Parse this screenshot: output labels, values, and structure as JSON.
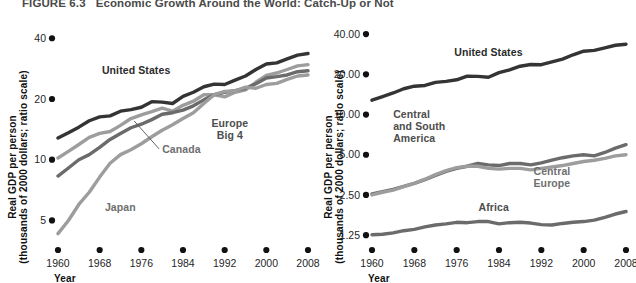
{
  "figure": {
    "number": "FIGURE 6.3",
    "caption": "Economic Growth Around the World: Catch-Up or Not"
  },
  "colors": {
    "dark": "#343434",
    "mid": "#6b6b6b",
    "light": "#9d9d9d",
    "axis": "#111111",
    "text": "#1a1a1a"
  },
  "chart_data": [
    {
      "type": "line",
      "id": "left",
      "title": "Catch-Up: Rich Industrial Countries",
      "xlabel": "Year",
      "ylabel": "Real GDP per person (thousands of 2000 dollars; ratio scale)",
      "ylabel_line1": "Real GDP per person",
      "ylabel_line2": "(thousands of 2000 dollars; ratio scale)",
      "xticks": [
        "1960",
        "1968",
        "1976",
        "1984",
        "1992",
        "2000",
        "2008"
      ],
      "xvalues": [
        1960,
        1968,
        1976,
        1984,
        1992,
        2000,
        2008
      ],
      "yticks": [
        "40",
        "20",
        "10",
        "5"
      ],
      "yvalues": [
        40,
        20,
        10,
        5
      ],
      "ylim": [
        4.0,
        46
      ],
      "xlim": [
        1960,
        2008
      ],
      "scale": "log",
      "grid": false,
      "legend": "inline-annotations",
      "series": [
        {
          "name": "United States",
          "color": "dark",
          "label_x": 1975,
          "label_y": 26.5,
          "x": [
            1960,
            1962,
            1964,
            1966,
            1968,
            1970,
            1972,
            1974,
            1976,
            1978,
            1980,
            1982,
            1984,
            1986,
            1988,
            1990,
            1992,
            1994,
            1996,
            1998,
            2000,
            2002,
            2004,
            2006,
            2008
          ],
          "values": [
            12.8,
            13.6,
            14.5,
            15.6,
            16.3,
            16.5,
            17.4,
            17.7,
            18.2,
            19.4,
            19.3,
            19.0,
            20.6,
            21.6,
            23.0,
            23.7,
            23.6,
            24.8,
            26.0,
            28.0,
            29.8,
            30.2,
            31.6,
            33.0,
            33.6
          ]
        },
        {
          "name": "Canada",
          "color": "light",
          "label_x": 1980,
          "label_y": 10.8,
          "leader": true,
          "x": [
            1960,
            1962,
            1964,
            1966,
            1968,
            1970,
            1972,
            1974,
            1976,
            1978,
            1980,
            1982,
            1984,
            1986,
            1988,
            1990,
            1992,
            1994,
            1996,
            1998,
            2000,
            2002,
            2004,
            2006,
            2008
          ],
          "values": [
            10.2,
            11.0,
            11.9,
            12.9,
            13.5,
            13.8,
            14.8,
            16.0,
            16.7,
            17.3,
            18.0,
            17.4,
            18.6,
            19.5,
            21.0,
            21.0,
            20.5,
            21.6,
            22.2,
            24.2,
            26.2,
            26.9,
            28.0,
            29.2,
            29.6
          ]
        },
        {
          "name": "Europe Big 4",
          "color": "mid",
          "label_x": 1993,
          "label_y": 14.6,
          "label_line2": "Big 4",
          "x": [
            1960,
            1962,
            1964,
            1966,
            1968,
            1970,
            1972,
            1974,
            1976,
            1978,
            1980,
            1982,
            1984,
            1986,
            1988,
            1990,
            1992,
            1994,
            1996,
            1998,
            2000,
            2002,
            2004,
            2006,
            2008
          ],
          "values": [
            8.3,
            9.1,
            10.0,
            10.6,
            11.5,
            12.6,
            13.5,
            14.4,
            15.0,
            15.8,
            16.8,
            17.1,
            17.6,
            18.5,
            19.8,
            21.0,
            21.6,
            22.0,
            22.6,
            23.8,
            25.4,
            25.8,
            26.3,
            27.3,
            27.6
          ]
        },
        {
          "name": "Japan",
          "color": "light",
          "label_x": 1969,
          "label_y": 5.6,
          "x": [
            1960,
            1962,
            1964,
            1966,
            1968,
            1970,
            1972,
            1974,
            1976,
            1978,
            1980,
            1982,
            1984,
            1986,
            1988,
            1990,
            1992,
            1994,
            1996,
            1998,
            2000,
            2002,
            2004,
            2006,
            2008
          ],
          "values": [
            4.3,
            5.0,
            6.0,
            6.9,
            8.2,
            9.6,
            10.6,
            11.2,
            12.0,
            13.0,
            14.0,
            14.9,
            16.0,
            17.1,
            19.0,
            21.0,
            21.8,
            21.9,
            22.9,
            22.6,
            23.6,
            23.9,
            25.0,
            26.0,
            26.3
          ]
        }
      ]
    },
    {
      "type": "line",
      "id": "right",
      "title": "No Catch-Up: Poor Developing Regions",
      "xlabel": "Year",
      "ylabel": "Real GDP per person (thousands of 2000 dollars; ratio scale)",
      "ylabel_line1": "Real GDP per person",
      "ylabel_line2": "(thousands of 2000 dollars; ratio scale)",
      "xticks": [
        "1960",
        "1968",
        "1976",
        "1984",
        "1992",
        "2000",
        "2008"
      ],
      "xvalues": [
        1960,
        1968,
        1976,
        1984,
        1992,
        2000,
        2008
      ],
      "yticks": [
        "40.00",
        "20.00",
        "10.00",
        "5.00",
        "2.50",
        "1.25"
      ],
      "yvalues": [
        40.0,
        20.0,
        10.0,
        5.0,
        2.5,
        1.25
      ],
      "ylim": [
        1.15,
        46
      ],
      "xlim": [
        1960,
        2008
      ],
      "scale": "log",
      "grid": false,
      "legend": "inline-annotations",
      "series": [
        {
          "name": "United States",
          "color": "dark",
          "label_x": 1982,
          "label_y": 27.5,
          "x": [
            1960,
            1962,
            1964,
            1966,
            1968,
            1970,
            1972,
            1974,
            1976,
            1978,
            1980,
            1982,
            1984,
            1986,
            1988,
            1990,
            1992,
            1994,
            1996,
            1998,
            2000,
            2002,
            2004,
            2006,
            2008
          ],
          "values": [
            12.8,
            13.6,
            14.5,
            15.6,
            16.3,
            16.5,
            17.4,
            17.7,
            18.2,
            19.4,
            19.3,
            19.0,
            20.6,
            21.6,
            23.0,
            23.7,
            23.6,
            24.8,
            26.0,
            28.0,
            29.8,
            30.2,
            31.6,
            33.0,
            33.6
          ]
        },
        {
          "name": "Central and South America",
          "color": "mid",
          "label_x": 1964,
          "label_y": 9.4,
          "label_line1": "Central",
          "label_line2": "and South",
          "label_line3": "America",
          "x": [
            1960,
            1962,
            1964,
            1966,
            1968,
            1970,
            1972,
            1974,
            1976,
            1978,
            1980,
            1982,
            1984,
            1986,
            1988,
            1990,
            1992,
            1994,
            1996,
            1998,
            2000,
            2002,
            2004,
            2006,
            2008
          ],
          "values": [
            2.55,
            2.65,
            2.75,
            2.9,
            3.05,
            3.25,
            3.5,
            3.75,
            3.95,
            4.1,
            4.3,
            4.2,
            4.15,
            4.3,
            4.3,
            4.2,
            4.35,
            4.55,
            4.75,
            4.9,
            5.0,
            4.9,
            5.2,
            5.6,
            5.95
          ]
        },
        {
          "name": "Central Europe",
          "color": "light",
          "label_x": 1994,
          "label_y": 3.55,
          "label_line2": "Europe",
          "x": [
            1960,
            1962,
            1964,
            1966,
            1968,
            1970,
            1972,
            1974,
            1976,
            1978,
            1980,
            1982,
            1984,
            1986,
            1988,
            1990,
            1992,
            1994,
            1996,
            1998,
            2000,
            2002,
            2004,
            2006,
            2008
          ],
          "values": [
            2.5,
            2.62,
            2.72,
            2.88,
            3.05,
            3.28,
            3.55,
            3.8,
            4.0,
            4.1,
            4.1,
            3.95,
            3.9,
            3.95,
            3.95,
            3.85,
            3.95,
            4.05,
            4.15,
            4.3,
            4.45,
            4.55,
            4.7,
            4.9,
            5.0
          ]
        },
        {
          "name": "Africa",
          "color": "mid",
          "label_x": 1983,
          "label_y": 1.9,
          "x": [
            1960,
            1962,
            1964,
            1966,
            1968,
            1970,
            1972,
            1974,
            1976,
            1978,
            1980,
            1982,
            1984,
            1986,
            1988,
            1990,
            1992,
            1994,
            1996,
            1998,
            2000,
            2002,
            2004,
            2006,
            2008
          ],
          "values": [
            1.26,
            1.27,
            1.3,
            1.35,
            1.38,
            1.44,
            1.49,
            1.52,
            1.56,
            1.55,
            1.58,
            1.58,
            1.52,
            1.55,
            1.56,
            1.54,
            1.5,
            1.49,
            1.53,
            1.56,
            1.58,
            1.62,
            1.7,
            1.8,
            1.88
          ]
        }
      ]
    }
  ]
}
